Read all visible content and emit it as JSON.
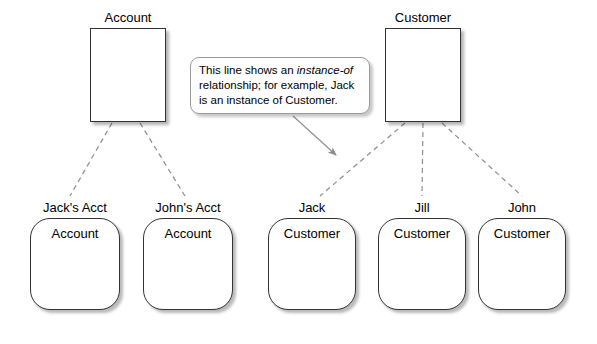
{
  "diagram": {
    "background_color": "#ffffff",
    "line_color": "#808080",
    "border_color": "#333333",
    "classes": [
      {
        "name": "account-class",
        "title": "Account",
        "x": 90,
        "y": 10,
        "w": 76
      },
      {
        "name": "customer-class",
        "title": "Customer",
        "x": 385,
        "y": 10,
        "w": 76
      }
    ],
    "instances": [
      {
        "name": "jacks-acct",
        "label": "Jack's Acct",
        "type": "Account",
        "x": 30,
        "y": 200,
        "w": 90
      },
      {
        "name": "johns-acct",
        "label": "John's Acct",
        "type": "Account",
        "x": 143,
        "y": 200,
        "w": 90
      },
      {
        "name": "jack",
        "label": "Jack",
        "type": "Customer",
        "x": 268,
        "y": 200,
        "w": 88
      },
      {
        "name": "jill",
        "label": "Jill",
        "type": "Customer",
        "x": 378,
        "y": 200,
        "w": 88
      },
      {
        "name": "john",
        "label": "John",
        "type": "Customer",
        "x": 478,
        "y": 200,
        "w": 88
      }
    ],
    "callout": {
      "text_before": "This line shows an ",
      "emphasis": "instance-of",
      "text_after": " relationship; for example, Jack is an instance of Customer."
    },
    "edges": [
      {
        "name": "account-to-jacks-acct",
        "x1": 112,
        "y1": 123,
        "x2": 70,
        "y2": 196
      },
      {
        "name": "account-to-johns-acct",
        "x1": 140,
        "y1": 123,
        "x2": 185,
        "y2": 196
      },
      {
        "name": "customer-to-jack",
        "x1": 405,
        "y1": 123,
        "x2": 320,
        "y2": 196
      },
      {
        "name": "customer-to-jill",
        "x1": 423,
        "y1": 123,
        "x2": 422,
        "y2": 196
      },
      {
        "name": "customer-to-john",
        "x1": 442,
        "y1": 123,
        "x2": 522,
        "y2": 196
      }
    ],
    "pointer": {
      "name": "callout-pointer",
      "x1": 293,
      "y1": 116,
      "x2": 338,
      "y2": 157
    }
  }
}
